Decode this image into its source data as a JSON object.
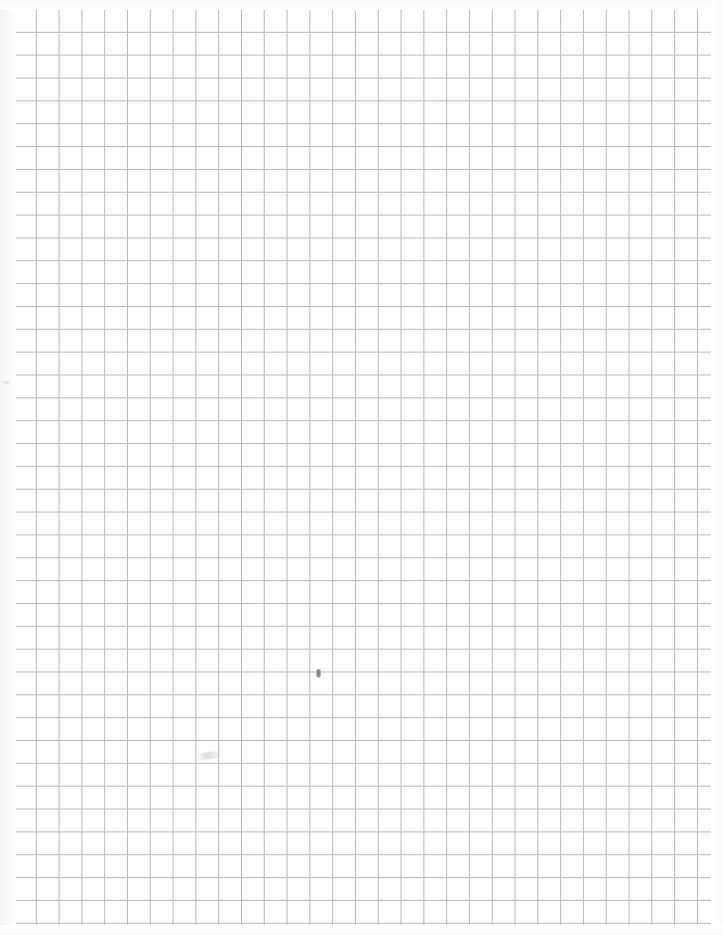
{
  "document": {
    "type": "scanned-graph-paper",
    "title": "Blank quadrille graph paper sheet",
    "description": "A scanned sheet of blank square-ruled graph paper with no printed text, labels, numbers or headings."
  },
  "canvas": {
    "width_px": 723,
    "height_px": 935,
    "background_color": "#ffffff",
    "paper_color": "#fefefe"
  },
  "grid": {
    "name": "square-ruled-grid",
    "left_px": 13,
    "top_px": 9,
    "width_px": 700,
    "height_px": 917,
    "cell_width_px": 22.8,
    "cell_height_px": 22.85,
    "columns": 30,
    "rows": 40,
    "line_color": "#b9b9b9",
    "border_color": "#b4b4b4",
    "line_width_px": 1,
    "cell_fill_color": "#fdfdfd"
  },
  "margins": {
    "left_px": 13,
    "top_px": 9,
    "right_px": 10,
    "bottom_px": 9,
    "margin_color": "#ffffff"
  },
  "marks": [
    {
      "name": "center-pencil-mark",
      "kind": "pencil-dot",
      "x_px": 318,
      "y_px": 673,
      "width_px": 5,
      "height_px": 9,
      "color": "#6d6d6d",
      "note": "small dark pencil dot near the middle of the sheet"
    },
    {
      "name": "faint-pencil-smudge",
      "kind": "pencil-smudge",
      "x_px": 210,
      "y_px": 755,
      "width_px": 26,
      "height_px": 7,
      "color": "#c4c4c4",
      "note": "very faint horizontal pencil smudge in lower-left quadrant"
    },
    {
      "name": "faint-edge-smudge",
      "kind": "scan-artifact",
      "x_px": 6,
      "y_px": 382,
      "width_px": 9,
      "height_px": 5,
      "color": "#c8c8c8",
      "note": "faint speck in the left margin from scanning"
    }
  ],
  "text_content": {
    "has_text": false,
    "labels": [],
    "headings": [],
    "numbers": []
  }
}
